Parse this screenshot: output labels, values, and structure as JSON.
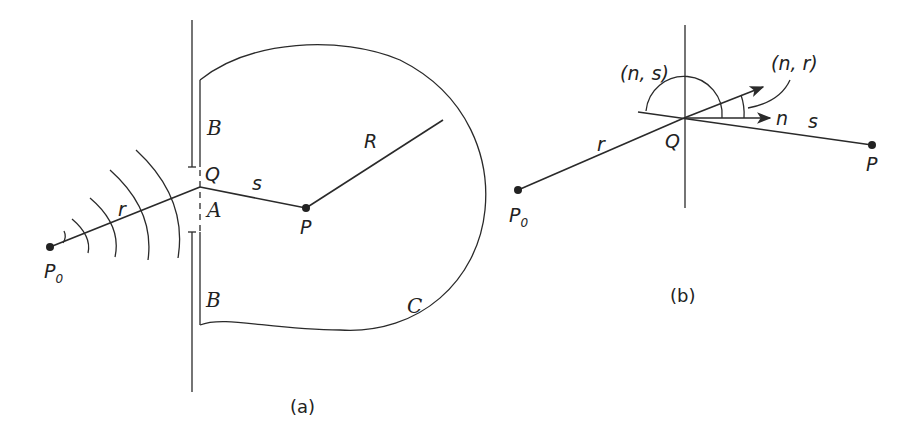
{
  "figure": {
    "panel_a": {
      "caption": "(a)",
      "labels": {
        "source_point": "P",
        "source_subscript": "0",
        "aperture_point": "Q",
        "observation_point": "P",
        "distance_r": "r",
        "distance_s": "s",
        "radius": "R",
        "screen_upper": "B",
        "screen_lower": "B",
        "aperture": "A",
        "surface": "C"
      }
    },
    "panel_b": {
      "caption": "(b)",
      "labels": {
        "source_point": "P",
        "source_subscript": "0",
        "aperture_point": "Q",
        "observation_point": "P",
        "distance_r": "r",
        "distance_s": "s",
        "normal": "n",
        "angle_ns": "(n, s)",
        "angle_nr": "(n, r)"
      }
    },
    "colors": {
      "line": "#2a2a2a",
      "background": "#ffffff"
    }
  }
}
